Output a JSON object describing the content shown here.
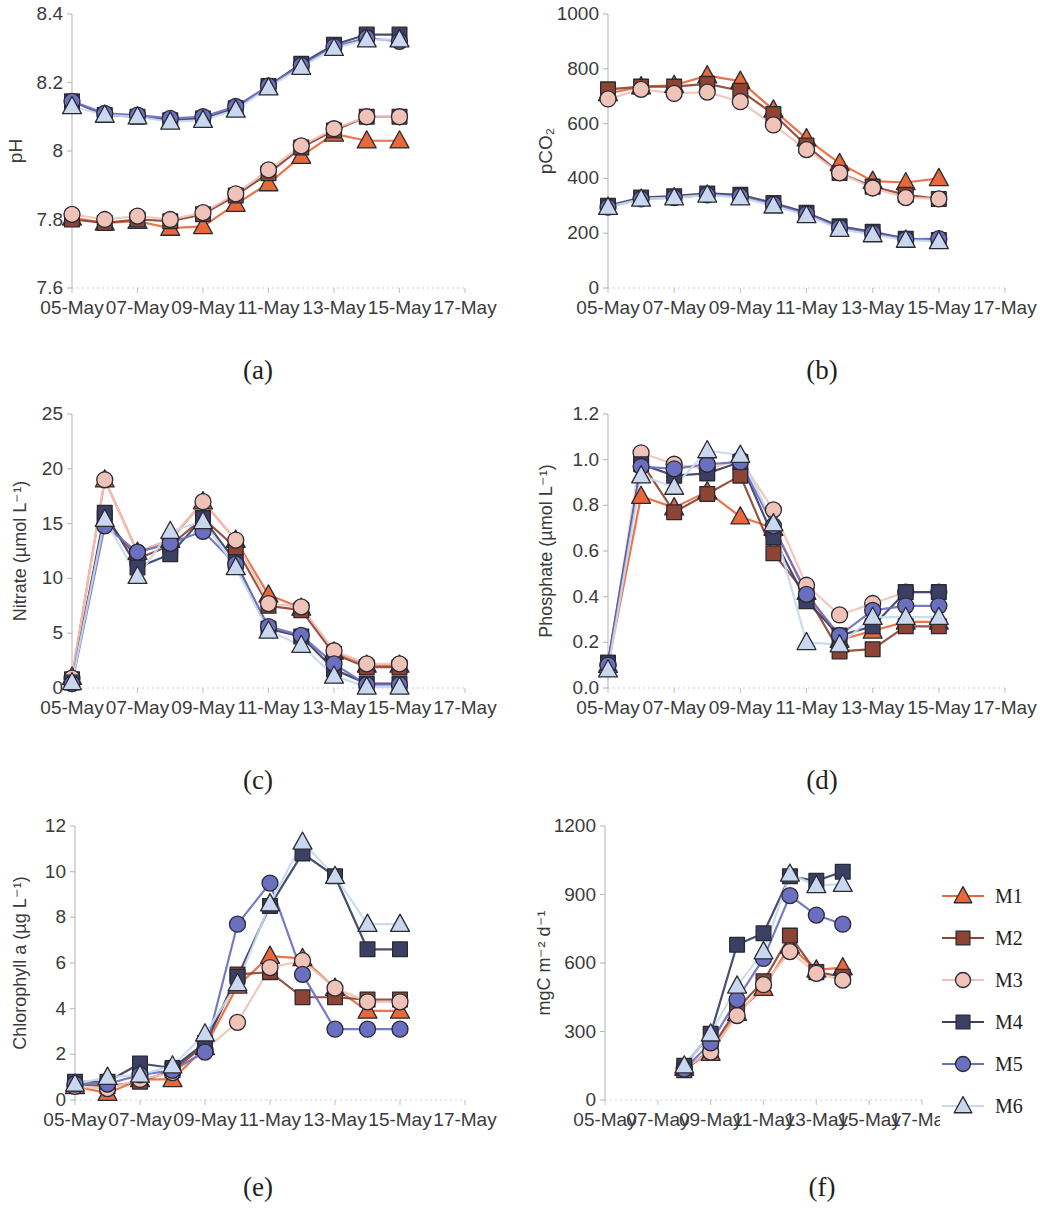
{
  "figure": {
    "x_categories": [
      "05-May",
      "06-May",
      "07-May",
      "08-May",
      "09-May",
      "10-May",
      "11-May",
      "12-May",
      "13-May",
      "14-May",
      "15-May"
    ],
    "x_tick_labels": [
      "05-May",
      "07-May",
      "09-May",
      "11-May",
      "13-May",
      "15-May",
      "17-May"
    ],
    "series_names": [
      "M1",
      "M2",
      "M3",
      "M4",
      "M5",
      "M6"
    ],
    "series_colors": [
      "#e8683c",
      "#8d4434",
      "#f0c3b8",
      "#3b3f63",
      "#6b6fc0",
      "#c9d8ef"
    ],
    "series_markers": [
      "triangle",
      "square",
      "circle",
      "square",
      "circle",
      "triangle"
    ],
    "captions": {
      "a": "(a)",
      "b": "(b)",
      "c": "(c)",
      "d": "(d)",
      "e": "(e)",
      "f": "(f)"
    },
    "legend": {
      "items": [
        {
          "label": "M1",
          "color": "#e8683c",
          "marker": "triangle"
        },
        {
          "label": "M2",
          "color": "#8d4434",
          "marker": "square"
        },
        {
          "label": "M3",
          "color": "#f0c3b8",
          "marker": "circle"
        },
        {
          "label": "M4",
          "color": "#3b3f63",
          "marker": "square"
        },
        {
          "label": "M5",
          "color": "#6b6fc0",
          "marker": "circle"
        },
        {
          "label": "M6",
          "color": "#c9d8ef",
          "marker": "triangle"
        }
      ]
    }
  },
  "chart_data": [
    {
      "panel": "a",
      "type": "line",
      "title": "",
      "ylabel": "pH",
      "xlabel": "",
      "ylim": [
        7.6,
        8.4
      ],
      "yticks": [
        7.6,
        7.8,
        8.0,
        8.2,
        8.4
      ],
      "ytick_labels": [
        "7.6",
        "7.8",
        "8",
        "8.2",
        "8.4"
      ],
      "x": [
        "05-May",
        "06-May",
        "07-May",
        "08-May",
        "09-May",
        "10-May",
        "11-May",
        "12-May",
        "13-May",
        "14-May",
        "15-May"
      ],
      "xtick_labels": [
        "05-May",
        "07-May",
        "09-May",
        "11-May",
        "13-May",
        "15-May",
        "17-May"
      ],
      "grid": false,
      "legend_position": "none",
      "series": [
        {
          "name": "M1",
          "values": [
            7.805,
            7.79,
            7.795,
            7.775,
            7.78,
            7.845,
            7.905,
            7.985,
            8.05,
            8.03,
            8.03
          ]
        },
        {
          "name": "M2",
          "values": [
            7.8,
            7.79,
            7.8,
            7.795,
            7.815,
            7.87,
            7.935,
            8.01,
            8.06,
            8.1,
            8.1
          ]
        },
        {
          "name": "M3",
          "values": [
            7.815,
            7.8,
            7.81,
            7.8,
            7.82,
            7.875,
            7.945,
            8.015,
            8.065,
            8.1,
            8.1
          ]
        },
        {
          "name": "M4",
          "values": [
            8.145,
            8.105,
            8.1,
            8.09,
            8.095,
            8.125,
            8.19,
            8.255,
            8.31,
            8.34,
            8.34
          ]
        },
        {
          "name": "M5",
          "values": [
            8.145,
            8.11,
            8.105,
            8.095,
            8.1,
            8.13,
            8.19,
            8.25,
            8.305,
            8.33,
            8.32
          ]
        },
        {
          "name": "M6",
          "values": [
            8.13,
            8.105,
            8.1,
            8.085,
            8.09,
            8.12,
            8.185,
            8.245,
            8.3,
            8.325,
            8.325
          ]
        }
      ]
    },
    {
      "panel": "b",
      "type": "line",
      "title": "",
      "ylabel": "pCO₂",
      "xlabel": "",
      "ylim": [
        0,
        1000
      ],
      "yticks": [
        0,
        200,
        400,
        600,
        800,
        1000
      ],
      "ytick_labels": [
        "0",
        "200",
        "400",
        "600",
        "800",
        "1000"
      ],
      "x": [
        "05-May",
        "06-May",
        "07-May",
        "08-May",
        "09-May",
        "10-May",
        "11-May",
        "12-May",
        "13-May",
        "14-May",
        "15-May"
      ],
      "xtick_labels": [
        "05-May",
        "07-May",
        "09-May",
        "11-May",
        "13-May",
        "15-May",
        "17-May"
      ],
      "grid": false,
      "legend_position": "none",
      "series": [
        {
          "name": "M1",
          "values": [
            710,
            735,
            740,
            775,
            755,
            650,
            545,
            455,
            390,
            385,
            400
          ]
        },
        {
          "name": "M2",
          "values": [
            725,
            735,
            735,
            745,
            720,
            635,
            520,
            420,
            370,
            340,
            325
          ]
        },
        {
          "name": "M3",
          "values": [
            690,
            725,
            710,
            715,
            680,
            595,
            505,
            420,
            365,
            330,
            325
          ]
        },
        {
          "name": "M4",
          "values": [
            300,
            330,
            335,
            345,
            340,
            310,
            275,
            225,
            205,
            180,
            175
          ]
        },
        {
          "name": "M5",
          "values": [
            295,
            325,
            330,
            340,
            335,
            305,
            270,
            220,
            200,
            178,
            180
          ]
        },
        {
          "name": "M6",
          "values": [
            295,
            325,
            330,
            340,
            330,
            300,
            265,
            215,
            195,
            175,
            170
          ]
        }
      ]
    },
    {
      "panel": "c",
      "type": "line",
      "title": "",
      "ylabel": "Nitrate (µmol L⁻¹)",
      "xlabel": "",
      "ylim": [
        0,
        25
      ],
      "yticks": [
        0,
        5,
        10,
        15,
        20,
        25
      ],
      "ytick_labels": [
        "0",
        "5",
        "10",
        "15",
        "20",
        "25"
      ],
      "x": [
        "05-May",
        "06-May",
        "07-May",
        "08-May",
        "09-May",
        "10-May",
        "11-May",
        "12-May",
        "13-May",
        "14-May",
        "15-May"
      ],
      "xtick_labels": [
        "05-May",
        "07-May",
        "09-May",
        "11-May",
        "13-May",
        "15-May",
        "17-May"
      ],
      "grid": false,
      "legend_position": "none",
      "series": [
        {
          "name": "M1",
          "values": [
            1.0,
            19.0,
            12.4,
            13.5,
            17.0,
            13.5,
            8.5,
            7.3,
            3.3,
            2.1,
            2.1
          ]
        },
        {
          "name": "M2",
          "values": [
            0.8,
            15.5,
            11.8,
            13.0,
            15.5,
            12.8,
            7.5,
            7.1,
            3.1,
            1.9,
            1.9
          ]
        },
        {
          "name": "M3",
          "values": [
            0.9,
            19.0,
            12.4,
            13.6,
            17.0,
            13.5,
            7.7,
            7.4,
            3.4,
            2.2,
            2.2
          ]
        },
        {
          "name": "M4",
          "values": [
            0.5,
            16.0,
            11.0,
            12.2,
            15.5,
            11.5,
            5.4,
            4.7,
            1.7,
            0.4,
            0.4
          ]
        },
        {
          "name": "M5",
          "values": [
            0.4,
            14.8,
            12.4,
            13.2,
            14.3,
            11.3,
            5.6,
            4.8,
            2.2,
            0.3,
            0.3
          ]
        },
        {
          "name": "M6",
          "values": [
            0.5,
            15.4,
            10.2,
            14.3,
            15.2,
            11.0,
            5.2,
            3.9,
            1.1,
            0.1,
            0.1
          ]
        }
      ]
    },
    {
      "panel": "d",
      "type": "line",
      "title": "",
      "ylabel": "Phosphate (µmol L⁻¹)",
      "xlabel": "",
      "ylim": [
        0.0,
        1.2
      ],
      "yticks": [
        0.0,
        0.2,
        0.4,
        0.6,
        0.8,
        1.0,
        1.2
      ],
      "ytick_labels": [
        "0.0",
        "0.2",
        "0.4",
        "0.6",
        "0.8",
        "1.0",
        "1.2"
      ],
      "x": [
        "05-May",
        "06-May",
        "07-May",
        "08-May",
        "09-May",
        "10-May",
        "11-May",
        "12-May",
        "13-May",
        "14-May",
        "15-May"
      ],
      "xtick_labels": [
        "05-May",
        "07-May",
        "09-May",
        "11-May",
        "13-May",
        "15-May",
        "17-May"
      ],
      "grid": false,
      "legend_position": "none",
      "series": [
        {
          "name": "M1",
          "values": [
            0.1,
            0.84,
            0.79,
            0.86,
            0.75,
            0.7,
            0.42,
            0.21,
            0.25,
            0.29,
            0.29
          ]
        },
        {
          "name": "M2",
          "values": [
            0.11,
            0.99,
            0.77,
            0.85,
            0.93,
            0.59,
            0.41,
            0.16,
            0.17,
            0.27,
            0.27
          ]
        },
        {
          "name": "M3",
          "values": [
            0.1,
            1.03,
            0.98,
            0.96,
            1.0,
            0.78,
            0.45,
            0.32,
            0.37,
            0.42,
            0.42
          ]
        },
        {
          "name": "M4",
          "values": [
            0.11,
            0.98,
            0.93,
            0.94,
            0.99,
            0.66,
            0.38,
            0.23,
            0.27,
            0.42,
            0.42
          ]
        },
        {
          "name": "M5",
          "values": [
            0.1,
            0.97,
            0.96,
            0.98,
            0.99,
            0.71,
            0.41,
            0.23,
            0.34,
            0.36,
            0.36
          ]
        },
        {
          "name": "M6",
          "values": [
            0.08,
            0.93,
            0.88,
            1.04,
            1.02,
            0.72,
            0.2,
            0.19,
            0.31,
            0.31,
            0.31
          ]
        }
      ]
    },
    {
      "panel": "e",
      "type": "line",
      "title": "",
      "ylabel": "Chlorophyll a (µg L⁻¹)",
      "xlabel": "",
      "ylim": [
        0,
        12
      ],
      "yticks": [
        0,
        2,
        4,
        6,
        8,
        10,
        12
      ],
      "ytick_labels": [
        "0",
        "2",
        "4",
        "6",
        "8",
        "10",
        "12"
      ],
      "x": [
        "05-May",
        "06-May",
        "07-May",
        "08-May",
        "09-May",
        "10-May",
        "11-May",
        "12-May",
        "13-May",
        "14-May",
        "15-May"
      ],
      "xtick_labels": [
        "05-May",
        "07-May",
        "09-May",
        "11-May",
        "13-May",
        "15-May",
        "17-May"
      ],
      "grid": false,
      "legend_position": "none",
      "series": [
        {
          "name": "M1",
          "values": [
            0.6,
            0.3,
            0.9,
            0.9,
            2.3,
            5.0,
            6.3,
            6.2,
            4.9,
            3.9,
            3.9
          ]
        },
        {
          "name": "M2",
          "values": [
            0.7,
            0.6,
            0.8,
            1.3,
            2.4,
            5.5,
            5.6,
            4.5,
            4.5,
            4.4,
            4.4
          ]
        },
        {
          "name": "M3",
          "values": [
            0.6,
            0.5,
            0.9,
            1.2,
            2.2,
            3.4,
            5.8,
            6.1,
            4.9,
            4.3,
            4.3
          ]
        },
        {
          "name": "M4",
          "values": [
            0.8,
            0.8,
            1.6,
            1.4,
            2.5,
            5.4,
            8.5,
            10.8,
            9.8,
            6.6,
            6.6
          ]
        },
        {
          "name": "M5",
          "values": [
            0.7,
            0.7,
            1.1,
            1.3,
            2.1,
            7.7,
            9.5,
            5.5,
            3.1,
            3.1,
            3.1
          ]
        },
        {
          "name": "M6",
          "values": [
            0.7,
            1.0,
            1.1,
            1.5,
            2.9,
            5.1,
            8.6,
            11.3,
            9.8,
            7.7,
            7.7
          ]
        }
      ]
    },
    {
      "panel": "f",
      "type": "line",
      "title": "",
      "ylabel": "mgC m⁻² d⁻¹",
      "xlabel": "",
      "ylim": [
        0,
        1200
      ],
      "yticks": [
        0,
        300,
        600,
        900,
        1200
      ],
      "ytick_labels": [
        "0",
        "300",
        "600",
        "900",
        "1200"
      ],
      "x": [
        "08-May",
        "09-May",
        "10-May",
        "11-May",
        "12-May",
        "13-May",
        "14-May"
      ],
      "xtick_labels": [
        "05-May",
        "07-May",
        "09-May",
        "11-May",
        "13-May",
        "15-May",
        "17-May"
      ],
      "grid": false,
      "legend_position": "right",
      "series": [
        {
          "name": "M1",
          "values": [
            140,
            205,
            380,
            490,
            675,
            570,
            580
          ]
        },
        {
          "name": "M2",
          "values": [
            130,
            220,
            400,
            520,
            720,
            560,
            540
          ]
        },
        {
          "name": "M3",
          "values": [
            140,
            210,
            370,
            505,
            650,
            555,
            525
          ]
        },
        {
          "name": "M4",
          "values": [
            150,
            290,
            680,
            730,
            980,
            960,
            1000
          ]
        },
        {
          "name": "M5",
          "values": [
            135,
            250,
            440,
            620,
            895,
            810,
            770
          ]
        },
        {
          "name": "M6",
          "values": [
            150,
            290,
            500,
            650,
            990,
            940,
            945
          ]
        }
      ]
    }
  ]
}
